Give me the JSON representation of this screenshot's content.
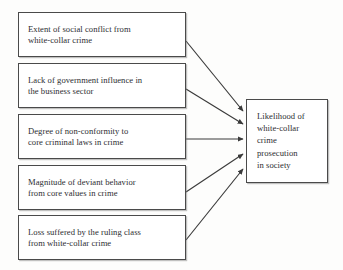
{
  "diagram": {
    "title": "Likelihood of white-collar crime prosecution in society",
    "type": "influence-diagram",
    "colors": {
      "background": "#fdfdfc",
      "box_fill": "#ffffff",
      "box_border": "#4a4a4a",
      "text": "#2d2d31",
      "arrow": "#3a3a3a"
    },
    "factors": [
      {
        "id": "social-conflict",
        "label": "Extent of social conflict from\nwhite-collar crime",
        "box": {
          "x": 18,
          "y": 12,
          "w": 168,
          "h": 45
        }
      },
      {
        "id": "government-influence",
        "label": "Lack of government influence in\nthe business sector",
        "box": {
          "x": 18,
          "y": 63,
          "w": 168,
          "h": 45
        }
      },
      {
        "id": "non-conformity",
        "label": "Degree of non-conformity to\ncore criminal laws in crime",
        "box": {
          "x": 18,
          "y": 114,
          "w": 168,
          "h": 45
        }
      },
      {
        "id": "deviant-behavior",
        "label": "Magnitude of deviant behavior\nfrom core values in crime",
        "box": {
          "x": 18,
          "y": 165,
          "w": 168,
          "h": 45
        }
      },
      {
        "id": "ruling-class-loss",
        "label": "Loss suffered by the ruling class\nfrom white-collar crime",
        "box": {
          "x": 18,
          "y": 215,
          "w": 168,
          "h": 45
        }
      }
    ],
    "outcome": {
      "id": "prosecution-likelihood",
      "label": "Likelihood of\nwhite-collar\ncrime\nprosecution\nin society",
      "box": {
        "x": 246,
        "y": 99,
        "w": 82,
        "h": 84
      }
    },
    "arrows": [
      {
        "id": "arrow-social-conflict-to-outcome",
        "from": "social-conflict",
        "to": "prosecution-likelihood",
        "x1": 186,
        "y1": 41,
        "x2": 243,
        "y2": 111
      },
      {
        "id": "arrow-government-influence-to-outcome",
        "from": "government-influence",
        "to": "prosecution-likelihood",
        "x1": 186,
        "y1": 89,
        "x2": 243,
        "y2": 124
      },
      {
        "id": "arrow-non-conformity-to-outcome",
        "from": "non-conformity",
        "to": "prosecution-likelihood",
        "x1": 186,
        "y1": 139,
        "x2": 243,
        "y2": 139
      },
      {
        "id": "arrow-deviant-behavior-to-outcome",
        "from": "deviant-behavior",
        "to": "prosecution-likelihood",
        "x1": 186,
        "y1": 192,
        "x2": 243,
        "y2": 154
      },
      {
        "id": "arrow-ruling-class-loss-to-outcome",
        "from": "ruling-class-loss",
        "to": "prosecution-likelihood",
        "x1": 186,
        "y1": 240,
        "x2": 243,
        "y2": 169
      }
    ]
  }
}
